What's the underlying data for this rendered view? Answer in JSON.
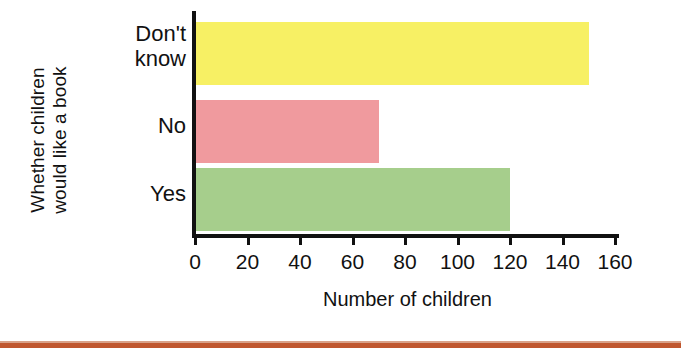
{
  "chart_data": {
    "type": "bar",
    "orientation": "horizontal",
    "title": "",
    "xlabel": "Number of children",
    "ylabel": "Whether children would like a book",
    "ylabel_lines": [
      "Whether children",
      "would like a book"
    ],
    "categories": [
      "Yes",
      "No",
      "Don't know"
    ],
    "category_lines": [
      [
        "Yes"
      ],
      [
        "No"
      ],
      [
        "Don't",
        "know"
      ]
    ],
    "values": [
      120,
      70,
      150
    ],
    "series": [
      {
        "name": "Number of children",
        "values": [
          120,
          70,
          150
        ]
      }
    ],
    "bars": [
      {
        "category": "Don't know",
        "value": 150,
        "color": "#F7F064"
      },
      {
        "category": "No",
        "value": 70,
        "color": "#F09A9E"
      },
      {
        "category": "Yes",
        "value": 120,
        "color": "#A6CE8C"
      }
    ],
    "xlim": [
      0,
      160
    ],
    "xticks": [
      0,
      20,
      40,
      60,
      80,
      100,
      120,
      140,
      160
    ],
    "xtick_labels": [
      "0",
      "20",
      "40",
      "60",
      "80",
      "100",
      "120",
      "140",
      "160"
    ],
    "grid": false,
    "legend": false,
    "legend_position": "none"
  },
  "colors": {
    "dont_know": "#F7F064",
    "no": "#F09A9E",
    "yes": "#A6CE8C",
    "axis": "#111111",
    "footer_rule": "#C0562E",
    "background": "#FFFFFF"
  },
  "decoration": {
    "footer_rule_present": true
  }
}
